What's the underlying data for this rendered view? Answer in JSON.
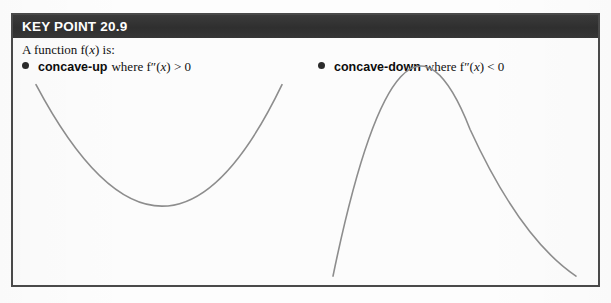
{
  "header": {
    "title": "KEY POINT 20.9",
    "bar_color": "#333333",
    "text_color": "#ffffff"
  },
  "box": {
    "border_color": "#4a4a4a",
    "background_color": "#fbfbfb"
  },
  "content": {
    "intro_prefix": "A function f(",
    "intro_var": "x",
    "intro_suffix": ") is:",
    "intro_full": "A function f(x) is:",
    "bullets": [
      {
        "marker": "bullet-dot",
        "term": "concave-up",
        "condition_prefix": "where f″(",
        "condition_var": "x",
        "condition_suffix": ") > 0",
        "condition_full": "where f″(x) > 0"
      },
      {
        "marker": "bullet-dot",
        "term": "concave-down",
        "condition_prefix": "where f″(",
        "condition_var": "x",
        "condition_suffix": ") < 0",
        "condition_full": "where f″(x) < 0"
      }
    ]
  },
  "chart_data": {
    "type": "line",
    "title": "KEY POINT 20.9",
    "xlabel": "",
    "ylabel": "",
    "grid": false,
    "legend_position": "none",
    "axis_shown": false,
    "curve_color": "#8d8d8d",
    "series": [
      {
        "name": "concave-up",
        "description": "Upward-opening parabola illustrating f″(x) > 0",
        "shape": "parabola-up",
        "path": "M 36 85 Q 165 330 282 85",
        "endpoints": [
          [
            36,
            85
          ],
          [
            282,
            85
          ]
        ],
        "vertex": [
          165,
          275
        ],
        "x": [
          36,
          75,
          110,
          140,
          165,
          195,
          225,
          255,
          282
        ],
        "y": [
          85,
          155,
          215,
          255,
          275,
          255,
          210,
          150,
          85
        ]
      },
      {
        "name": "concave-down",
        "description": "Downward-opening parabola illustrating f″(x) < 0",
        "shape": "parabola-down",
        "path": "M 333 278 Q 400 -50 470 130 Q 520 240 576 278",
        "endpoints": [
          [
            333,
            278
          ],
          [
            576,
            278
          ]
        ],
        "vertex": [
          435,
          82
        ],
        "x": [
          333,
          360,
          390,
          412,
          435,
          470,
          505,
          540,
          576
        ],
        "y": [
          278,
          205,
          130,
          95,
          82,
          130,
          190,
          236,
          278
        ]
      }
    ]
  }
}
